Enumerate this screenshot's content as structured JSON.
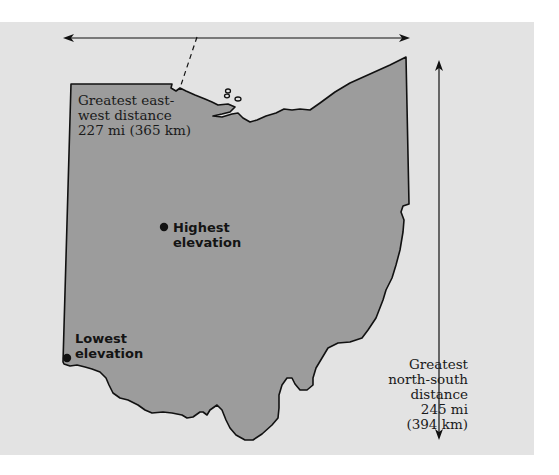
{
  "figure": {
    "colors": {
      "background_panel": "#e3e3e3",
      "state_fill": "#9c9c9c",
      "outline": "#111111"
    }
  },
  "labels": {
    "east_west": {
      "lines": [
        "Greatest east-",
        "west distance",
        "227 mi (365 km)"
      ]
    },
    "north_south": {
      "lines": [
        "Greatest",
        "north-south",
        "distance",
        "245 mi",
        "(394 km)"
      ]
    },
    "highest": {
      "lines": [
        "Highest",
        "elevation"
      ]
    },
    "lowest": {
      "lines": [
        "Lowest",
        "elevation"
      ]
    }
  },
  "markers": {
    "highest_point": {
      "name": "Highest elevation",
      "x": 164,
      "y": 227
    },
    "lowest_point": {
      "name": "Lowest elevation",
      "x": 67,
      "y": 358
    }
  },
  "measurements": {
    "east_west": {
      "miles": 227,
      "km": 365
    },
    "north_south": {
      "miles": 245,
      "km": 394
    }
  }
}
